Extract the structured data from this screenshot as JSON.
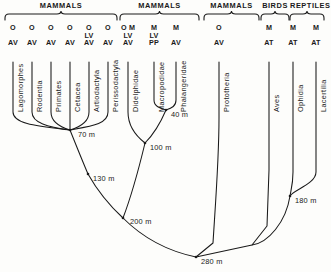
{
  "diagram": {
    "time_unit": "m",
    "line_color": "#1a1a1a",
    "background": "#fdfdfb"
  },
  "groups": [
    {
      "name": "group-mammals-placental",
      "label": "MAMMALS",
      "x": 5,
      "width": 112
    },
    {
      "name": "group-mammals-marsupial",
      "label": "MAMMALS",
      "x": 120,
      "width": 79
    },
    {
      "name": "group-mammals-prototheria",
      "label": "MAMMALS",
      "x": 204,
      "width": 55
    },
    {
      "name": "group-birds",
      "label": "BIRDS",
      "x": 261,
      "width": 28
    },
    {
      "name": "group-reptiles",
      "label": "REPTILES",
      "x": 290,
      "width": 34
    }
  ],
  "taxa": [
    {
      "name": "taxon-lagomorphes",
      "label": "Lagomorphes",
      "x": 13,
      "codes": [
        "O",
        "",
        "AV"
      ]
    },
    {
      "name": "taxon-rodentia",
      "label": "Rodentia",
      "x": 32,
      "codes": [
        "O",
        "",
        "AV"
      ]
    },
    {
      "name": "taxon-primates",
      "label": "Primates",
      "x": 51,
      "codes": [
        "O",
        "",
        "AV"
      ]
    },
    {
      "name": "taxon-cetacea",
      "label": "Cetacea",
      "x": 70,
      "codes": [
        "O",
        "",
        "AV"
      ]
    },
    {
      "name": "taxon-artiodactyla",
      "label": "Artiodactyla",
      "x": 89,
      "codes": [
        "O",
        "LV",
        "AV"
      ]
    },
    {
      "name": "taxon-perissodactyla",
      "label": "Perissodactyla",
      "x": 108,
      "codes": [
        "O",
        "",
        "AV"
      ]
    },
    {
      "name": "taxon-didelphidae",
      "label": "Didelphidae",
      "x": 128,
      "codes": [
        "O M",
        "LV",
        "AV"
      ]
    },
    {
      "name": "taxon-macropodidae",
      "label": "Macropodidae",
      "x": 154,
      "codes": [
        "M",
        "LV",
        "PP"
      ]
    },
    {
      "name": "taxon-phalangeridae",
      "label": "Phalangeridae",
      "x": 176,
      "codes": [
        "M",
        "",
        "AV"
      ]
    },
    {
      "name": "taxon-prototheria",
      "label": "Prototheria",
      "x": 219,
      "codes": [
        "O",
        "",
        "AV"
      ]
    },
    {
      "name": "taxon-aves",
      "label": "Aves",
      "x": 269,
      "codes": [
        "M",
        "",
        "AT"
      ]
    },
    {
      "name": "taxon-ophidia",
      "label": "Ophidia",
      "x": 293,
      "codes": [
        "M",
        "",
        "AT"
      ]
    },
    {
      "name": "taxon-lacertilia",
      "label": "Lacertilia",
      "x": 316,
      "codes": [
        "M",
        "",
        "AT"
      ]
    }
  ],
  "nodes": [
    {
      "name": "node-70m",
      "label": "70 m",
      "x": 70,
      "y": 130,
      "lx": 78,
      "ly": 134
    },
    {
      "name": "node-40m",
      "label": "40 m",
      "x": 166,
      "y": 110,
      "lx": 171,
      "ly": 114
    },
    {
      "name": "node-100m",
      "label": "100 m",
      "x": 145,
      "y": 143,
      "lx": 150,
      "ly": 147
    },
    {
      "name": "node-130m",
      "label": "130 m",
      "x": 88,
      "y": 174,
      "lx": 93,
      "ly": 178
    },
    {
      "name": "node-180m",
      "label": "180 m",
      "x": 290,
      "y": 196,
      "lx": 295,
      "ly": 200
    },
    {
      "name": "node-200m",
      "label": "200 m",
      "x": 123,
      "y": 218,
      "lx": 130,
      "ly": 221
    },
    {
      "name": "node-280m",
      "label": "280 m",
      "x": 196,
      "y": 257,
      "lx": 201,
      "ly": 261
    }
  ],
  "branches": [
    {
      "name": "branch-lagomorphes",
      "d": "M13,62 L13,112 C13,124 36,126 70,130"
    },
    {
      "name": "branch-rodentia",
      "d": "M32,62 L32,112 C32,123 48,127 70,130"
    },
    {
      "name": "branch-primates",
      "d": "M51,62 L51,112 C51,122 60,127 70,130"
    },
    {
      "name": "branch-cetacea",
      "d": "M70,62 L70,130"
    },
    {
      "name": "branch-artiodactyla",
      "d": "M89,62 L89,112 C89,122 80,127 70,130"
    },
    {
      "name": "branch-perissodactyla",
      "d": "M108,62 L108,112 C108,124 92,126 70,130"
    },
    {
      "name": "branch-didelphidae",
      "d": "M128,62 L128,112 C128,127 136,136 145,143"
    },
    {
      "name": "branch-macropodidae",
      "d": "M154,62 L154,100 C154,106 159,108 166,110"
    },
    {
      "name": "branch-phalangeridae",
      "d": "M176,62 L176,100 C176,106 172,108 166,110"
    },
    {
      "name": "branch-40m-to-100m",
      "d": "M166,110 C160,124 153,135 145,143"
    },
    {
      "name": "branch-100m-to-200m",
      "d": "M145,143 C139,168 131,197 123,218"
    },
    {
      "name": "branch-70m-to-130m",
      "d": "M70,130 C76,145 82,160 88,174"
    },
    {
      "name": "branch-130m-to-200m",
      "d": "M88,174 C97,190 110,206 123,218"
    },
    {
      "name": "branch-200m-to-280m",
      "d": "M123,218 C145,240 172,252 196,257"
    },
    {
      "name": "branch-prototheria",
      "d": "M219,62 L219,118 C219,160 215,210 213,243 L196,257"
    },
    {
      "name": "branch-aves",
      "d": "M269,62 L269,170 L267,226 L252,245 L196,257"
    },
    {
      "name": "branch-ophidia",
      "d": "M293,62 L293,172 C293,184 291,190 290,196"
    },
    {
      "name": "branch-lacertilia",
      "d": "M316,62 L316,172 C316,184 293,190 290,196"
    },
    {
      "name": "branch-180m-to-base",
      "d": "M290,196 C286,222 268,243 252,245"
    }
  ]
}
